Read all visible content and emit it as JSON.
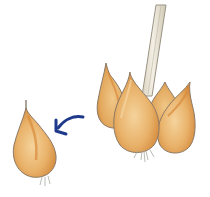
{
  "illustration": {
    "description": "Bulb cluster on a stem with a single offset bulblet separated to the left, indicated by a curved arrow",
    "elements": {
      "stem": {
        "icon": "stem",
        "color": "#e8e2d0",
        "outline": "#9a9484"
      },
      "bulb_cluster": {
        "icon": "bulb-cluster",
        "count": 4,
        "fill": "#e9b26a",
        "shade": "#d98e3e",
        "outline": "#8c7a66"
      },
      "offset_bulb": {
        "icon": "bulb",
        "fill": "#eab06a",
        "shade": "#d9893a",
        "outline": "#8c7a66"
      },
      "arrow": {
        "icon": "curved-arrow-left",
        "color": "#1f3a8a"
      },
      "roots": {
        "color": "#a8a8a0"
      }
    },
    "colors": {
      "background": "#ffffff",
      "bulb_light": "#f2cf97",
      "bulb_mid": "#e9b26a",
      "bulb_dark": "#d98e3e",
      "arrow_blue": "#1f3a8a"
    }
  }
}
